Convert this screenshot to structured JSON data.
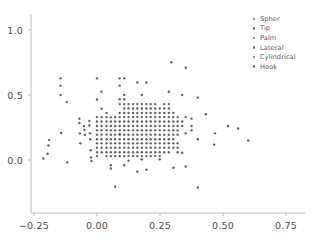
{
  "chart_data": {
    "type": "scatter",
    "title": "",
    "xlabel": "",
    "ylabel": "",
    "xlim": [
      -0.3,
      0.82
    ],
    "ylim": [
      -0.32,
      1.08
    ],
    "xticks": [
      -0.25,
      0.0,
      0.25,
      0.5,
      0.75
    ],
    "xticklabels": [
      "−0.25",
      "0.00",
      "0.25",
      "0.50",
      "0.75"
    ],
    "yticks": [
      0.0,
      0.5,
      1.0
    ],
    "yticklabels": [
      "0.0",
      "0.5",
      "1.0"
    ],
    "grid": false,
    "legend_position": "upper right",
    "marker_color": "#5f5f66",
    "marker_size": 2.4,
    "axis_color": "#b9b9bf",
    "series": [
      {
        "name": "Spher",
        "color": "#5f5f66",
        "points": [
          [
            -0.213,
            0.012
          ],
          [
            -0.196,
            0.048
          ],
          [
            -0.193,
            0.112
          ],
          [
            -0.19,
            0.153
          ],
          [
            -0.145,
            0.628
          ],
          [
            -0.145,
            0.572
          ],
          [
            -0.145,
            0.5
          ],
          [
            -0.142,
            0.208
          ],
          [
            -0.12,
            0.447
          ],
          [
            -0.118,
            -0.018
          ],
          [
            -0.07,
            0.318
          ],
          [
            -0.07,
            0.285
          ],
          [
            -0.068,
            0.205
          ],
          [
            -0.066,
            0.128
          ],
          [
            -0.052,
            0.262
          ],
          [
            -0.05,
            0.232
          ],
          [
            -0.048,
            0.192
          ],
          [
            -0.03,
            0.3
          ],
          [
            -0.03,
            0.265
          ],
          [
            -0.028,
            0.205
          ],
          [
            -0.027,
            0.16
          ],
          [
            -0.025,
            0.075
          ],
          [
            -0.024,
            0.02
          ],
          [
            -0.022,
            -0.008
          ],
          [
            0.0,
            0.628
          ],
          [
            0.0,
            0.465
          ],
          [
            0.0,
            0.33
          ],
          [
            0.0,
            0.296
          ],
          [
            0.0,
            0.262
          ],
          [
            0.0,
            0.228
          ],
          [
            0.0,
            0.195
          ],
          [
            0.0,
            0.16
          ],
          [
            0.0,
            0.128
          ],
          [
            0.0,
            0.095
          ],
          [
            0.0,
            0.06
          ],
          [
            0.0,
            0.03
          ]
        ]
      },
      {
        "name": "Tip",
        "color": "#5f5f66",
        "points": [
          [
            0.018,
            0.525
          ],
          [
            0.018,
            0.395
          ],
          [
            0.018,
            0.33
          ],
          [
            0.018,
            0.296
          ],
          [
            0.018,
            0.262
          ],
          [
            0.018,
            0.228
          ],
          [
            0.018,
            0.195
          ],
          [
            0.018,
            0.16
          ],
          [
            0.018,
            0.128
          ],
          [
            0.018,
            0.095
          ],
          [
            0.018,
            0.06
          ],
          [
            0.038,
            0.362
          ],
          [
            0.038,
            0.33
          ],
          [
            0.038,
            0.296
          ],
          [
            0.038,
            0.262
          ],
          [
            0.038,
            0.228
          ],
          [
            0.038,
            0.195
          ],
          [
            0.038,
            0.16
          ],
          [
            0.038,
            0.128
          ],
          [
            0.038,
            0.095
          ],
          [
            0.038,
            0.06
          ],
          [
            0.038,
            0.03
          ],
          [
            0.055,
            0.328
          ],
          [
            0.055,
            0.296
          ],
          [
            0.055,
            0.262
          ],
          [
            0.055,
            0.228
          ],
          [
            0.055,
            0.195
          ],
          [
            0.055,
            0.16
          ],
          [
            0.055,
            0.128
          ],
          [
            0.055,
            0.095
          ],
          [
            0.055,
            0.06
          ],
          [
            0.055,
            0.03
          ],
          [
            0.055,
            -0.04
          ],
          [
            0.055,
            -0.065
          ],
          [
            0.072,
            0.33
          ],
          [
            0.072,
            0.296
          ],
          [
            0.072,
            0.262
          ],
          [
            0.072,
            0.228
          ],
          [
            0.072,
            0.195
          ],
          [
            0.072,
            0.16
          ],
          [
            0.072,
            0.128
          ],
          [
            0.072,
            0.095
          ],
          [
            0.072,
            0.06
          ],
          [
            0.072,
            0.03
          ]
        ]
      },
      {
        "name": "Palm",
        "color": "#5f5f66",
        "points": [
          [
            0.09,
            0.628
          ],
          [
            0.09,
            0.572
          ],
          [
            0.09,
            0.468
          ],
          [
            0.09,
            0.43
          ],
          [
            0.09,
            0.362
          ],
          [
            0.09,
            0.33
          ],
          [
            0.09,
            0.296
          ],
          [
            0.09,
            0.262
          ],
          [
            0.09,
            0.228
          ],
          [
            0.09,
            0.195
          ],
          [
            0.09,
            0.16
          ],
          [
            0.09,
            0.128
          ],
          [
            0.09,
            0.095
          ],
          [
            0.09,
            0.06
          ],
          [
            0.09,
            0.03
          ],
          [
            0.09,
            0.198
          ],
          [
            0.072,
            -0.205
          ],
          [
            0.108,
            0.628
          ],
          [
            0.108,
            0.5
          ],
          [
            0.108,
            0.468
          ],
          [
            0.108,
            0.43
          ],
          [
            0.108,
            0.396
          ],
          [
            0.108,
            0.362
          ],
          [
            0.108,
            0.33
          ],
          [
            0.108,
            0.296
          ],
          [
            0.108,
            0.262
          ],
          [
            0.108,
            0.228
          ],
          [
            0.108,
            0.195
          ],
          [
            0.108,
            0.16
          ],
          [
            0.108,
            0.128
          ],
          [
            0.108,
            0.095
          ],
          [
            0.108,
            0.06
          ],
          [
            0.108,
            0.03
          ],
          [
            0.108,
            -0.04
          ],
          [
            0.125,
            0.43
          ],
          [
            0.125,
            0.396
          ],
          [
            0.125,
            0.362
          ],
          [
            0.125,
            0.33
          ],
          [
            0.125,
            0.296
          ],
          [
            0.125,
            0.262
          ],
          [
            0.125,
            0.228
          ],
          [
            0.125,
            0.195
          ],
          [
            0.125,
            0.16
          ],
          [
            0.125,
            0.128
          ],
          [
            0.125,
            0.095
          ],
          [
            0.125,
            0.06
          ],
          [
            0.125,
            0.03
          ],
          [
            0.125,
            -0.005
          ]
        ]
      },
      {
        "name": "Lateral",
        "color": "#5f5f66",
        "points": [
          [
            0.143,
            0.43
          ],
          [
            0.143,
            0.396
          ],
          [
            0.143,
            0.362
          ],
          [
            0.143,
            0.33
          ],
          [
            0.143,
            0.296
          ],
          [
            0.143,
            0.262
          ],
          [
            0.143,
            0.228
          ],
          [
            0.143,
            0.195
          ],
          [
            0.143,
            0.16
          ],
          [
            0.143,
            0.128
          ],
          [
            0.143,
            0.095
          ],
          [
            0.143,
            0.06
          ],
          [
            0.143,
            0.03
          ],
          [
            0.16,
            0.596
          ],
          [
            0.16,
            0.43
          ],
          [
            0.16,
            0.396
          ],
          [
            0.16,
            0.362
          ],
          [
            0.16,
            0.33
          ],
          [
            0.16,
            0.296
          ],
          [
            0.16,
            0.262
          ],
          [
            0.16,
            0.228
          ],
          [
            0.16,
            0.195
          ],
          [
            0.16,
            0.16
          ],
          [
            0.16,
            0.128
          ],
          [
            0.16,
            0.095
          ],
          [
            0.16,
            0.06
          ],
          [
            0.16,
            0.03
          ],
          [
            0.16,
            -0.09
          ],
          [
            0.178,
            0.5
          ],
          [
            0.178,
            0.43
          ],
          [
            0.178,
            0.396
          ],
          [
            0.178,
            0.362
          ],
          [
            0.178,
            0.33
          ],
          [
            0.178,
            0.296
          ],
          [
            0.178,
            0.262
          ],
          [
            0.178,
            0.228
          ],
          [
            0.178,
            0.195
          ],
          [
            0.178,
            0.16
          ],
          [
            0.178,
            0.128
          ],
          [
            0.178,
            0.095
          ],
          [
            0.178,
            0.06
          ],
          [
            0.178,
            0.03
          ],
          [
            0.178,
            0.005
          ]
        ]
      },
      {
        "name": "Cylindrical",
        "color": "#5f5f66",
        "points": [
          [
            0.196,
            0.596
          ],
          [
            0.196,
            0.43
          ],
          [
            0.196,
            0.396
          ],
          [
            0.196,
            0.362
          ],
          [
            0.196,
            0.33
          ],
          [
            0.196,
            0.296
          ],
          [
            0.196,
            0.262
          ],
          [
            0.196,
            0.228
          ],
          [
            0.196,
            0.195
          ],
          [
            0.196,
            0.16
          ],
          [
            0.196,
            0.128
          ],
          [
            0.196,
            0.095
          ],
          [
            0.196,
            0.06
          ],
          [
            0.196,
            0.03
          ],
          [
            0.196,
            -0.075
          ],
          [
            0.213,
            0.43
          ],
          [
            0.213,
            0.396
          ],
          [
            0.213,
            0.362
          ],
          [
            0.213,
            0.33
          ],
          [
            0.213,
            0.296
          ],
          [
            0.213,
            0.262
          ],
          [
            0.213,
            0.228
          ],
          [
            0.213,
            0.195
          ],
          [
            0.213,
            0.16
          ],
          [
            0.213,
            0.128
          ],
          [
            0.213,
            0.095
          ],
          [
            0.213,
            0.06
          ],
          [
            0.213,
            0.03
          ],
          [
            0.231,
            0.43
          ],
          [
            0.231,
            0.396
          ],
          [
            0.231,
            0.362
          ],
          [
            0.231,
            0.33
          ],
          [
            0.231,
            0.296
          ],
          [
            0.231,
            0.262
          ],
          [
            0.231,
            0.228
          ],
          [
            0.231,
            0.195
          ],
          [
            0.231,
            0.16
          ],
          [
            0.231,
            0.128
          ],
          [
            0.231,
            0.095
          ],
          [
            0.231,
            0.06
          ],
          [
            0.231,
            0.03
          ],
          [
            0.249,
            0.396
          ],
          [
            0.249,
            0.362
          ],
          [
            0.249,
            0.33
          ],
          [
            0.249,
            0.296
          ],
          [
            0.249,
            0.262
          ],
          [
            0.249,
            0.228
          ],
          [
            0.249,
            0.195
          ],
          [
            0.249,
            0.16
          ],
          [
            0.249,
            0.128
          ],
          [
            0.249,
            0.095
          ],
          [
            0.249,
            0.06
          ],
          [
            0.249,
            0.03
          ],
          [
            0.249,
            0.005
          ]
        ]
      },
      {
        "name": "Hook",
        "color": "#5f5f66",
        "points": [
          [
            0.267,
            0.43
          ],
          [
            0.267,
            0.396
          ],
          [
            0.267,
            0.362
          ],
          [
            0.267,
            0.33
          ],
          [
            0.267,
            0.296
          ],
          [
            0.267,
            0.262
          ],
          [
            0.267,
            0.228
          ],
          [
            0.267,
            0.195
          ],
          [
            0.267,
            0.16
          ],
          [
            0.267,
            0.128
          ],
          [
            0.267,
            0.095
          ],
          [
            0.267,
            0.06
          ],
          [
            0.285,
            0.525
          ],
          [
            0.285,
            0.43
          ],
          [
            0.285,
            0.396
          ],
          [
            0.285,
            0.362
          ],
          [
            0.285,
            0.33
          ],
          [
            0.285,
            0.296
          ],
          [
            0.285,
            0.262
          ],
          [
            0.285,
            0.228
          ],
          [
            0.285,
            0.195
          ],
          [
            0.285,
            0.16
          ],
          [
            0.285,
            0.128
          ],
          [
            0.285,
            0.095
          ],
          [
            0.285,
            0.06
          ],
          [
            0.295,
            0.752
          ],
          [
            0.303,
            0.362
          ],
          [
            0.303,
            0.33
          ],
          [
            0.303,
            0.296
          ],
          [
            0.303,
            0.262
          ],
          [
            0.303,
            0.228
          ],
          [
            0.303,
            0.195
          ],
          [
            0.303,
            0.16
          ],
          [
            0.303,
            0.128
          ],
          [
            0.303,
            0.095
          ],
          [
            0.303,
            -0.06
          ],
          [
            0.32,
            0.33
          ],
          [
            0.32,
            0.296
          ],
          [
            0.32,
            0.262
          ],
          [
            0.32,
            0.228
          ],
          [
            0.32,
            0.195
          ],
          [
            0.32,
            0.128
          ],
          [
            0.32,
            0.095
          ],
          [
            0.32,
            0.06
          ],
          [
            0.338,
            0.5
          ],
          [
            0.338,
            0.296
          ],
          [
            0.338,
            0.262
          ],
          [
            0.338,
            0.056
          ],
          [
            0.352,
            0.71
          ],
          [
            0.352,
            0.33
          ],
          [
            0.352,
            0.205
          ],
          [
            0.352,
            -0.05
          ],
          [
            0.375,
            0.318
          ],
          [
            0.375,
            0.262
          ],
          [
            0.375,
            0.228
          ],
          [
            0.4,
            0.48
          ],
          [
            0.4,
            0.16
          ],
          [
            0.4,
            -0.212
          ],
          [
            0.432,
            0.352
          ],
          [
            0.465,
            0.118
          ],
          [
            0.468,
            0.205
          ],
          [
            0.52,
            0.262
          ],
          [
            0.56,
            0.242
          ],
          [
            0.6,
            0.15
          ]
        ]
      }
    ]
  },
  "legend": {
    "items": [
      {
        "label": "Spher"
      },
      {
        "label": "Tip"
      },
      {
        "label": "Palm"
      },
      {
        "label": "Lateral"
      },
      {
        "label": "Cylindrical"
      },
      {
        "label": "Hook"
      }
    ]
  },
  "axes": {
    "y_labels": [
      "1.0",
      "0.5",
      "0.0"
    ],
    "x_labels": [
      "−0.25",
      "0.00",
      "0.25",
      "0.50",
      "0.75"
    ]
  }
}
